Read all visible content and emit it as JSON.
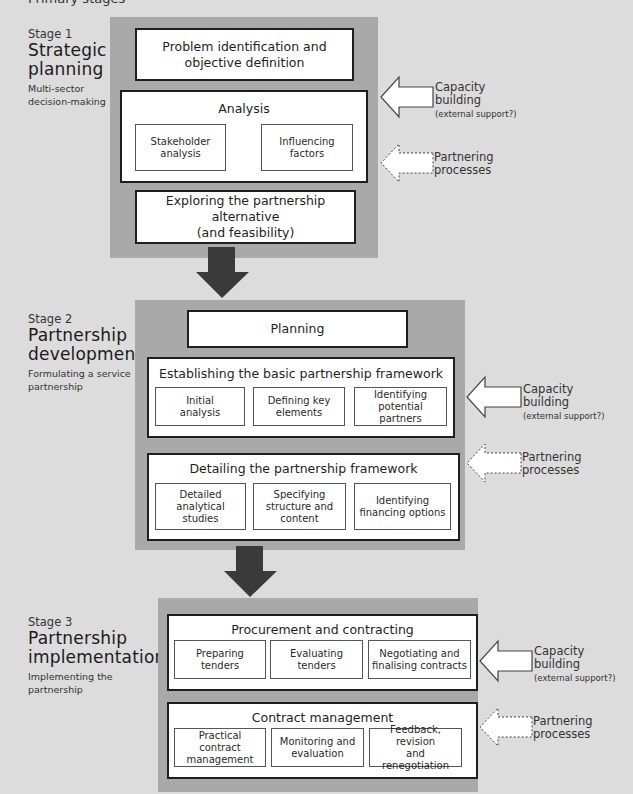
{
  "header": {
    "title": "Primary stages"
  },
  "colors": {
    "background": "#dcdcdc",
    "panel": "#a9a9a9",
    "box_border": "#1e1e1e",
    "flow_arrow": "#3a3a3a"
  },
  "stages": [
    {
      "number": "Stage 1",
      "name_line1": "Strategic",
      "name_line2": "planning",
      "desc_line1": "Multi-sector",
      "desc_line2": "decision-making",
      "boxes": [
        {
          "title_line1": "Problem identification and",
          "title_line2": "objective definition"
        },
        {
          "title": "Analysis",
          "items": [
            {
              "line1": "Stakeholder",
              "line2": "analysis"
            },
            {
              "line1": "Influencing",
              "line2": "factors"
            }
          ]
        },
        {
          "title_line1": "Exploring the partnership alternative",
          "title_line2": "(and feasibility)"
        }
      ],
      "capacity": {
        "line1": "Capacity",
        "line2": "building",
        "note": "(external support?)"
      },
      "partnering": {
        "line1": "Partnering",
        "line2": "processes"
      }
    },
    {
      "number": "Stage 2",
      "name_line1": "Partnership",
      "name_line2": "development",
      "desc_line1": "Formulating a service",
      "desc_line2": "partnership",
      "boxes": [
        {
          "title": "Planning"
        },
        {
          "title": "Establishing the basic partnership framework",
          "items": [
            {
              "line1": "Initial",
              "line2": "analysis"
            },
            {
              "line1": "Defining key",
              "line2": "elements"
            },
            {
              "line1": "Identifying",
              "line2": "potential partners"
            }
          ]
        },
        {
          "title": "Detailing the partnership framework",
          "items": [
            {
              "line1": "Detailed",
              "line2": "analytical studies"
            },
            {
              "line1": "Specifying",
              "line2": "structure and",
              "line3": "content"
            },
            {
              "line1": "Identifying",
              "line2": "financing options"
            }
          ]
        }
      ],
      "capacity": {
        "line1": "Capacity",
        "line2": "building",
        "note": "(external support?)"
      },
      "partnering": {
        "line1": "Partnering",
        "line2": "processes"
      }
    },
    {
      "number": "Stage 3",
      "name_line1": "Partnership",
      "name_line2": "implementation",
      "desc_line1": "Implementing the",
      "desc_line2": "partnership",
      "boxes": [
        {
          "title": "Procurement and contracting",
          "items": [
            {
              "line1": "Preparing",
              "line2": "tenders"
            },
            {
              "line1": "Evaluating",
              "line2": "tenders"
            },
            {
              "line1": "Negotiating and",
              "line2": "finalising contracts"
            }
          ]
        },
        {
          "title": "Contract management",
          "items": [
            {
              "line1": "Practical contract",
              "line2": "management"
            },
            {
              "line1": "Monitoring and",
              "line2": "evaluation"
            },
            {
              "line1": "Feedback, revision",
              "line2": "and renegotiation"
            }
          ]
        }
      ],
      "capacity": {
        "line1": "Capacity",
        "line2": "building",
        "note": "(external support?)"
      },
      "partnering": {
        "line1": "Partnering",
        "line2": "processes"
      }
    }
  ]
}
